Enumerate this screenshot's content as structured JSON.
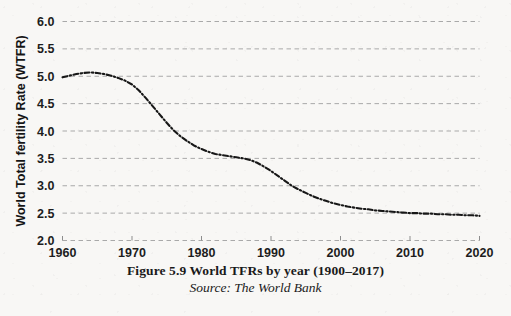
{
  "figure": {
    "caption": "Figure 5.9 World TFRs by year (1900–2017)",
    "source": "Source: The World Bank"
  },
  "colors": {
    "background": "#f8f7f5",
    "grid": "#a9a9a9",
    "axis": "#8d8d8d",
    "series": "#171717",
    "text": "#1a1a1a"
  },
  "chart_data": {
    "type": "line",
    "title": "",
    "xlabel": "",
    "ylabel": "World Total fertility Rate (WTFR)",
    "xlim": [
      1960,
      2020
    ],
    "ylim": [
      2.0,
      6.0
    ],
    "xticks": [
      1960,
      1970,
      1980,
      1990,
      2000,
      2010,
      2020
    ],
    "xtick_labels": [
      "1960",
      "1970",
      "1980",
      "1990",
      "2000",
      "2010",
      "2020"
    ],
    "yticks": [
      2.0,
      2.5,
      3.0,
      3.5,
      4.0,
      4.5,
      5.0,
      5.5,
      6.0
    ],
    "ytick_labels": [
      "2.0",
      "2.5",
      "3.0",
      "3.5",
      "4.0",
      "4.5",
      "5.0",
      "5.5",
      "6.0"
    ],
    "grid": true,
    "grid_style": "dashed",
    "legend": "none",
    "line_style": "dash-dot",
    "series": [
      {
        "name": "World Total Fertility Rate",
        "x": [
          1960,
          1961,
          1962,
          1963,
          1964,
          1965,
          1966,
          1967,
          1968,
          1969,
          1970,
          1971,
          1972,
          1973,
          1974,
          1975,
          1976,
          1977,
          1978,
          1979,
          1980,
          1981,
          1982,
          1983,
          1984,
          1985,
          1986,
          1987,
          1988,
          1989,
          1990,
          1991,
          1992,
          1993,
          1994,
          1995,
          1996,
          1997,
          1998,
          1999,
          2000,
          2001,
          2002,
          2003,
          2004,
          2005,
          2006,
          2007,
          2008,
          2009,
          2010,
          2011,
          2012,
          2013,
          2014,
          2015,
          2016,
          2017,
          2018,
          2019,
          2020
        ],
        "values": [
          4.98,
          5.01,
          5.04,
          5.06,
          5.07,
          5.06,
          5.04,
          5.01,
          4.97,
          4.92,
          4.85,
          4.74,
          4.6,
          4.45,
          4.3,
          4.15,
          4.01,
          3.9,
          3.81,
          3.73,
          3.67,
          3.62,
          3.58,
          3.56,
          3.54,
          3.52,
          3.5,
          3.47,
          3.42,
          3.35,
          3.27,
          3.18,
          3.09,
          3.0,
          2.93,
          2.87,
          2.81,
          2.76,
          2.72,
          2.68,
          2.65,
          2.62,
          2.6,
          2.58,
          2.57,
          2.55,
          2.54,
          2.53,
          2.52,
          2.51,
          2.5,
          2.5,
          2.49,
          2.49,
          2.48,
          2.48,
          2.47,
          2.47,
          2.46,
          2.46,
          2.45
        ]
      }
    ]
  }
}
